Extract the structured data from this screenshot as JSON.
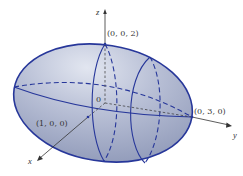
{
  "figure": {
    "type": "ellipsoid",
    "equation_semi_axes": {
      "x": 1,
      "y": 3,
      "z": 2
    },
    "colors": {
      "surface_fill": "#a9b2cc",
      "surface_highlight": "#dde2ee",
      "outline": "#27379a",
      "axis": "#333333",
      "background": "#ffffff"
    },
    "axes": {
      "x_label": "x",
      "y_label": "y",
      "z_label": "z"
    },
    "labels": {
      "origin": "0",
      "point_x": "(1, 0, 0)",
      "point_y": "(0, 3, 0)",
      "point_z": "(0, 0, 2)"
    }
  }
}
